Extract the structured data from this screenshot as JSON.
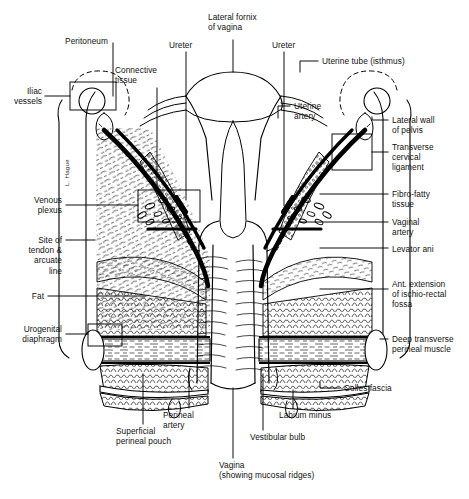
{
  "figure": {
    "kind": "anatomical-line-drawing",
    "style": "black-and-white pen-and-ink medical illustration",
    "artist_signature": "L. Hague",
    "background_color": "#ffffff",
    "ink_color": "#000000"
  },
  "labels": {
    "peritoneum": "Peritoneum",
    "iliac_vessels": "Iliac\nvessels",
    "connective_tissue": "Connective\ntissue",
    "ureter_left": "Ureter",
    "lateral_fornix": "Lateral fornix\nof vagina",
    "ureter_right": "Ureter",
    "uterine_tube": "Uterine tube (isthmus)",
    "uterine_artery": "Uterine\nartery",
    "lateral_wall": "Lateral wall\nof pelvis",
    "transverse_cervical_ligament": "Transverse\ncervical\nligament",
    "fibro_fatty_tissue": "Fibro-fatty\ntissue",
    "vaginal_artery": "Vaginal\nartery",
    "levator_ani": "Levator ani",
    "ant_extension": "Ant. extension\nof ischio-rectal\nfossa",
    "deep_transverse": "Deep transverse\nperineal muscle",
    "colles_fascia": "Colles fascia",
    "venous_plexus": "Venous\nplexus",
    "site_of_tendon": "Site of\ntendon &\narcuate\nline",
    "fat": "Fat",
    "urogenital_diaphragm": "Urogenital\ndiaphragm",
    "perineal_artery": "Perineal\nartery",
    "superficial_perineal_pouch": "Superficial\nperineal pouch",
    "vagina": "Vagina\n(showing mucosal ridges)",
    "vestibular_bulb": "Vestibular bulb",
    "labium_minus": "Labium minus"
  }
}
